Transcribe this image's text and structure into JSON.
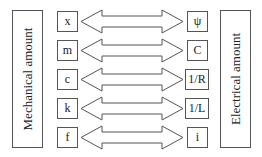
{
  "left_panel": {
    "label": "Mechanical amount"
  },
  "right_panel": {
    "label": "Electrical amount"
  },
  "pairs": [
    {
      "mechanical": "x",
      "electrical": "ψ"
    },
    {
      "mechanical": "m",
      "electrical": "C"
    },
    {
      "mechanical": "c",
      "electrical": "1/R"
    },
    {
      "mechanical": "k",
      "electrical": "1/L"
    },
    {
      "mechanical": "f",
      "electrical": "i"
    }
  ],
  "colors": {
    "stroke": "#555555",
    "background": "#ffffff",
    "text": "#222222"
  }
}
